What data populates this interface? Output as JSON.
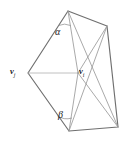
{
  "figure": {
    "type": "geometry-diagram",
    "background_color": "#ffffff",
    "outline_color": "#6f6f6f",
    "inner_edge_color": "#9a9a9a",
    "label_color": "#1a1a1a"
  },
  "labels": {
    "alpha": "α",
    "beta": "β",
    "vertex_i_base": "v",
    "vertex_i_sub": "i",
    "vertex_j_base": "v",
    "vertex_j_sub": "j"
  },
  "geometry": {
    "vertices": {
      "top": [
        68,
        11
      ],
      "upper_right": [
        107,
        26
      ],
      "right": [
        118,
        127
      ],
      "bottom": [
        69,
        131
      ],
      "left": [
        28,
        73
      ],
      "center": [
        78,
        73
      ]
    },
    "outline_path": "M 68 11 L 107 26 L 118 127 L 69 131 L 28 73 Z",
    "inner_edges": [
      {
        "name": "top-to-center",
        "from": [
          68,
          11
        ],
        "to": [
          78,
          73
        ]
      },
      {
        "name": "left-to-center",
        "from": [
          28,
          73
        ],
        "to": [
          78,
          73
        ]
      },
      {
        "name": "bottom-to-center",
        "from": [
          69,
          131
        ],
        "to": [
          78,
          73
        ]
      },
      {
        "name": "upper-right-to-center",
        "from": [
          107,
          26
        ],
        "to": [
          78,
          73
        ]
      },
      {
        "name": "right-to-center",
        "from": [
          118,
          127
        ],
        "to": [
          78,
          73
        ]
      },
      {
        "name": "top-to-right",
        "from": [
          68,
          11
        ],
        "to": [
          118,
          127
        ]
      },
      {
        "name": "upper-right-to-bottom",
        "from": [
          107,
          26
        ],
        "to": [
          69,
          131
        ]
      }
    ],
    "angle_arcs": [
      {
        "name": "alpha-arc",
        "at_vertex": [
          68,
          11
        ],
        "label": "α"
      },
      {
        "name": "beta-arc",
        "at_vertex": [
          69,
          131
        ],
        "label": "β"
      }
    ]
  }
}
